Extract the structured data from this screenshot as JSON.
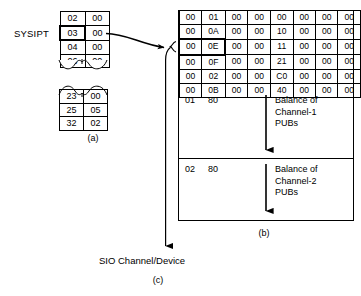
{
  "diagram": {
    "sysipt_label": "SYSIPT",
    "sio_label": "SIO Channel/Device",
    "captions": {
      "a": "(a)",
      "b": "(b)",
      "c": "(c)"
    }
  },
  "sysipt_table": {
    "name": "SYSIPT logical unit table",
    "rows": [
      {
        "left": "02",
        "right": "00",
        "highlighted": false
      },
      {
        "left": "03",
        "right": "00",
        "highlighted": true
      },
      {
        "left": "04",
        "right": "00",
        "highlighted": false
      },
      {
        "left": "06",
        "right": "00",
        "highlighted": false
      }
    ]
  },
  "second_table": {
    "name": "Continued logical unit table",
    "rows": [
      {
        "left": "23",
        "right": "00",
        "highlighted": false
      },
      {
        "left": "25",
        "right": "05",
        "highlighted": false
      },
      {
        "left": "32",
        "right": "02",
        "highlighted": false
      }
    ]
  },
  "pub_grid": {
    "name": "PUB table hex entries",
    "columns": 8,
    "rows": [
      {
        "cells": [
          "00",
          "01",
          "00",
          "00",
          "00",
          "00",
          "00",
          "00"
        ],
        "highlighted": false
      },
      {
        "cells": [
          "00",
          "0A",
          "00",
          "00",
          "10",
          "00",
          "00",
          "00"
        ],
        "highlighted": false
      },
      {
        "cells": [
          "00",
          "0E",
          "00",
          "00",
          "11",
          "00",
          "00",
          "00"
        ],
        "highlighted": true
      },
      {
        "cells": [
          "00",
          "0F",
          "00",
          "00",
          "21",
          "00",
          "00",
          "00"
        ],
        "highlighted": false
      },
      {
        "cells": [
          "00",
          "02",
          "00",
          "00",
          "C0",
          "00",
          "00",
          "00"
        ],
        "highlighted": false
      },
      {
        "cells": [
          "00",
          "0B",
          "00",
          "00",
          "40",
          "00",
          "00",
          "00"
        ],
        "highlighted": false
      }
    ]
  },
  "balance_sections": [
    {
      "code_1": "01",
      "code_2": "80",
      "text_lines": [
        "Balance of",
        "Channel-1",
        "PUBs"
      ]
    },
    {
      "code_1": "02",
      "code_2": "80",
      "text_lines": [
        "Balance of",
        "Channel-2",
        "PUBs"
      ]
    }
  ],
  "colors": {
    "stroke": "#000000",
    "background": "#ffffff"
  }
}
